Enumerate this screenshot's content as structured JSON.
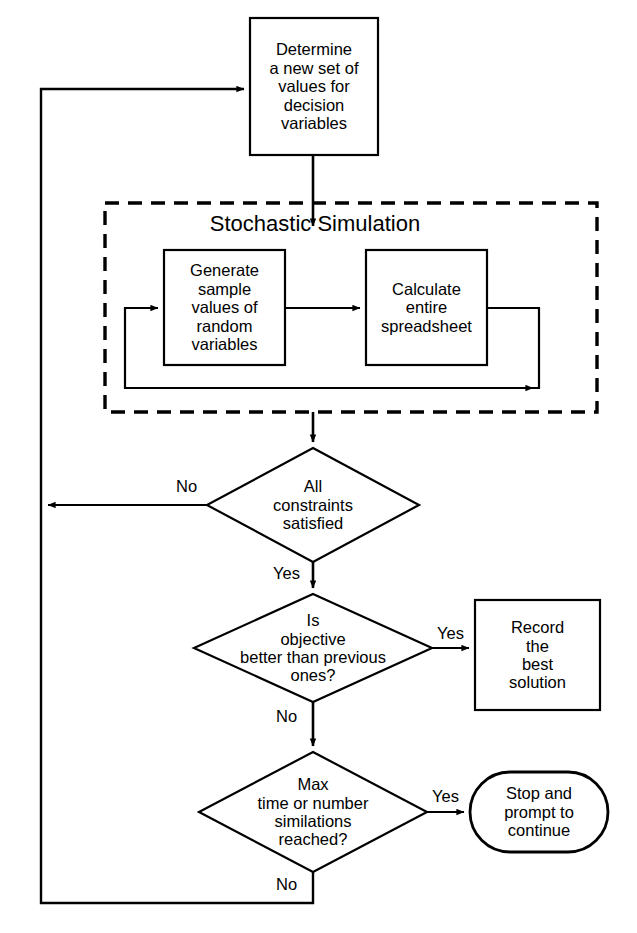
{
  "diagram": {
    "type": "flowchart",
    "background_color": "#ffffff",
    "stroke_color": "#000000"
  },
  "group": {
    "label": "Stochastic Simulation",
    "border_style": "dashed"
  },
  "nodes": {
    "determine_values": {
      "label": "Determine\na new set of\nvalues for\ndecision\nvariables",
      "shape": "rectangle"
    },
    "generate_samples": {
      "label": "Generate\nsample\nvalues of\nrandom\nvariables",
      "shape": "rectangle"
    },
    "calculate_spreadsheet": {
      "label": "Calculate\nentire\nspreadsheet",
      "shape": "rectangle"
    },
    "constraints_check": {
      "label": "All\nconstraints\nsatisfied",
      "shape": "diamond"
    },
    "objective_check": {
      "label": "Is\nobjective\nbetter than previous\nones?",
      "shape": "diamond"
    },
    "limit_check": {
      "label": "Max\ntime or number\nsimilations\nreached?",
      "shape": "diamond"
    },
    "record_solution": {
      "label": "Record\nthe\nbest\nsolution",
      "shape": "rectangle"
    },
    "stop_prompt": {
      "label": "Stop and\nprompt to\ncontinue",
      "shape": "stadium"
    }
  },
  "edge_labels": {
    "constraints_no": "No",
    "constraints_yes": "Yes",
    "objective_yes": "Yes",
    "objective_no": "No",
    "limit_yes": "Yes",
    "limit_no": "No"
  }
}
